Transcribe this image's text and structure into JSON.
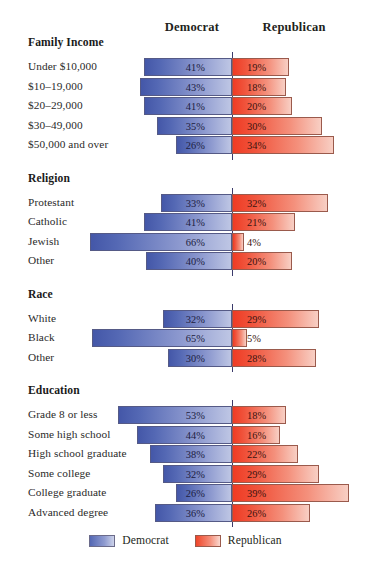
{
  "header": {
    "democrat_label": "Democrat",
    "republican_label": "Republican"
  },
  "legend": {
    "democrat": "Democrat",
    "republican": "Republican"
  },
  "colors": {
    "democrat": "#4457a8",
    "republican": "#ef3b24",
    "center_line": "#3b3b6b",
    "background": "#ffffff"
  },
  "chart_data": {
    "type": "bar",
    "title": "",
    "subtitle": "",
    "xlabel": "",
    "ylabel": "",
    "orientation": "horizontal",
    "style": "diverging-bidirectional",
    "grid": false,
    "legend_position": "bottom-center",
    "value_unit": "%",
    "series": [
      {
        "name": "Democrat",
        "direction": "left",
        "color": "#4457a8"
      },
      {
        "name": "Republican",
        "direction": "right",
        "color": "#ef3b24"
      }
    ],
    "sections": [
      {
        "title": "Family Income",
        "rows": [
          {
            "label": "Under $10,000",
            "democrat": 41,
            "republican": 19,
            "democrat_text": "41%",
            "republican_text": "19%"
          },
          {
            "label": "$10–19,000",
            "democrat": 43,
            "republican": 18,
            "democrat_text": "43%",
            "republican_text": "18%"
          },
          {
            "label": "$20–29,000",
            "democrat": 41,
            "republican": 20,
            "democrat_text": "41%",
            "republican_text": "20%"
          },
          {
            "label": "$30–49,000",
            "democrat": 35,
            "republican": 30,
            "democrat_text": "35%",
            "republican_text": "30%"
          },
          {
            "label": "$50,000 and over",
            "democrat": 26,
            "republican": 34,
            "democrat_text": "26%",
            "republican_text": "34%"
          }
        ]
      },
      {
        "title": "Religion",
        "rows": [
          {
            "label": "Protestant",
            "democrat": 33,
            "republican": 32,
            "democrat_text": "33%",
            "republican_text": "32%"
          },
          {
            "label": "Catholic",
            "democrat": 41,
            "republican": 21,
            "democrat_text": "41%",
            "republican_text": "21%"
          },
          {
            "label": "Jewish",
            "democrat": 66,
            "republican": 4,
            "democrat_text": "66%",
            "republican_text": "4%"
          },
          {
            "label": "Other",
            "democrat": 40,
            "republican": 20,
            "democrat_text": "40%",
            "republican_text": "20%"
          }
        ]
      },
      {
        "title": "Race",
        "rows": [
          {
            "label": "White",
            "democrat": 32,
            "republican": 29,
            "democrat_text": "32%",
            "republican_text": "29%"
          },
          {
            "label": "Black",
            "democrat": 65,
            "republican": 5,
            "democrat_text": "65%",
            "republican_text": "5%"
          },
          {
            "label": "Other",
            "democrat": 30,
            "republican": 28,
            "democrat_text": "30%",
            "republican_text": "28%"
          }
        ]
      },
      {
        "title": "Education",
        "rows": [
          {
            "label": "Grade 8 or less",
            "democrat": 53,
            "republican": 18,
            "democrat_text": "53%",
            "republican_text": "18%"
          },
          {
            "label": "Some high school",
            "democrat": 44,
            "republican": 16,
            "democrat_text": "44%",
            "republican_text": "16%"
          },
          {
            "label": "High school graduate",
            "democrat": 38,
            "republican": 22,
            "democrat_text": "38%",
            "republican_text": "22%"
          },
          {
            "label": "Some college",
            "democrat": 32,
            "republican": 29,
            "democrat_text": "32%",
            "republican_text": "29%"
          },
          {
            "label": "College graduate",
            "democrat": 26,
            "republican": 39,
            "democrat_text": "26%",
            "republican_text": "39%"
          },
          {
            "label": "Advanced degree",
            "democrat": 36,
            "republican": 26,
            "democrat_text": "36%",
            "republican_text": "26%"
          }
        ]
      }
    ]
  }
}
